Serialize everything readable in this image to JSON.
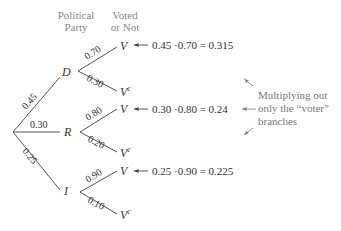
{
  "headers": {
    "party_line1": "Political",
    "party_line2": "Party",
    "vote_line1": "Voted",
    "vote_line2": "or Not"
  },
  "tree": {
    "root_branches": [
      {
        "party": "D",
        "prob": "0.45",
        "voted": {
          "label": "V",
          "prob": "0.70"
        },
        "not_voted": {
          "label": "V",
          "sup": "c",
          "prob": "0.30"
        },
        "calc": "0.45 ·0.70 = 0.315"
      },
      {
        "party": "R",
        "prob": "0.30",
        "voted": {
          "label": "V",
          "prob": "0.80"
        },
        "not_voted": {
          "label": "V",
          "sup": "c",
          "prob": "0.20"
        },
        "calc": "0.30 ·0.80 = 0.24"
      },
      {
        "party": "I",
        "prob": "0.25",
        "voted": {
          "label": "V",
          "prob": "0.90"
        },
        "not_voted": {
          "label": "V",
          "sup": "c",
          "prob": "0.10"
        },
        "calc": "0.25 ·0.90 = 0.225"
      }
    ]
  },
  "annotation": {
    "line1": "Multiplying out",
    "line2": "only the “voter”",
    "line3": "branches"
  },
  "colors": {
    "text": "#333333",
    "header": "#8a8a8a",
    "note": "#7a7a7a",
    "lines": "#555555"
  }
}
